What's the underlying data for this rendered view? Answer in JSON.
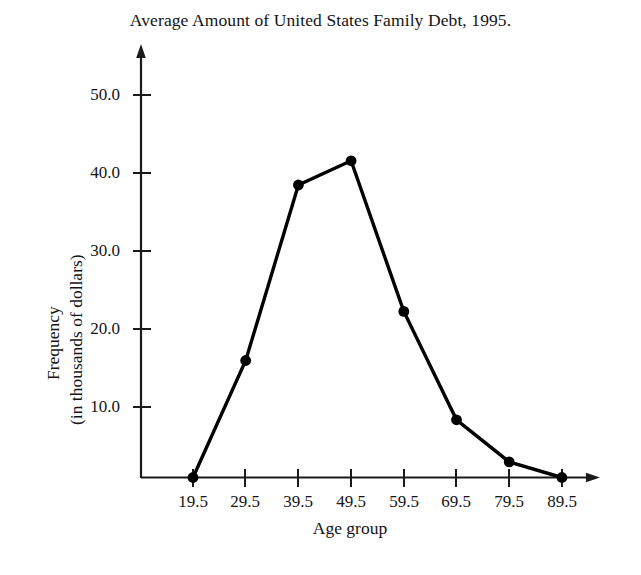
{
  "chart_data": {
    "type": "line",
    "title": "Average Amount of United States Family Debt, 1995.",
    "xlabel": "Age group",
    "ylabel_line1": "Frequency",
    "ylabel_line2": "(in thousands of dollars)",
    "categories": [
      "19.5",
      "29.5",
      "39.5",
      "49.5",
      "59.5",
      "69.5",
      "79.5",
      "89.5"
    ],
    "values": [
      0.0,
      15.0,
      37.5,
      40.6,
      21.3,
      7.4,
      2.0,
      0.0
    ],
    "x_tick_labels": [
      "19.5",
      "29.5",
      "39.5",
      "49.5",
      "59.5",
      "69.5",
      "79.5",
      "89.5"
    ],
    "y_tick_labels": [
      "10.0",
      "20.0",
      "30.0",
      "40.0",
      "50.0"
    ],
    "y_tick_values": [
      10.0,
      20.0,
      30.0,
      40.0,
      50.0
    ],
    "ylim": [
      0,
      55
    ],
    "grid": false,
    "legend": "none",
    "marker": "filled-circle",
    "line_color": "#000000",
    "marker_color": "#000000",
    "axis_color": "#1a1a1a",
    "background_color": "#ffffff"
  }
}
